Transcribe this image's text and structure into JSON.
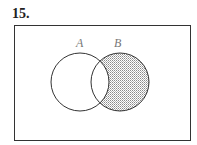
{
  "problem": {
    "number": "15."
  },
  "venn": {
    "labels": {
      "a": "A",
      "b": "B"
    },
    "shaded_region": "B only (B minus A)",
    "colors": {
      "stroke": "#333333",
      "shade": "#9a9a9a",
      "label": "#777777"
    }
  }
}
